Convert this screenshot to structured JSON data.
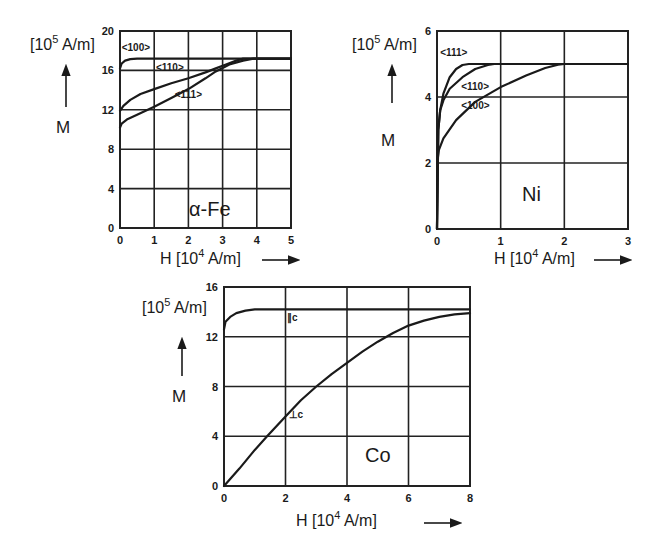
{
  "chart_data": [
    {
      "type": "line",
      "id": "fe",
      "title": "α-Fe",
      "xlabel": "H [10^4 A/m] →",
      "ylabel": "M",
      "yunit": "[10^5 A/m]",
      "xlim": [
        0,
        5
      ],
      "ylim": [
        0,
        20
      ],
      "xticks": [
        0,
        1,
        2,
        3,
        4,
        5
      ],
      "yticks": [
        0,
        4,
        8,
        12,
        16,
        20
      ],
      "grid": true,
      "box": {
        "x0": 120,
        "y0": 31,
        "x1": 291,
        "y1": 228
      },
      "series": [
        {
          "name": "<100>",
          "x": [
            0,
            0.05,
            0.15,
            0.3,
            0.5,
            1,
            2,
            3,
            4,
            5
          ],
          "y": [
            16.2,
            16.7,
            17.0,
            17.15,
            17.2,
            17.2,
            17.2,
            17.2,
            17.2,
            17.2
          ],
          "label_at": [
            0.05,
            18.0
          ]
        },
        {
          "name": "<110>",
          "x": [
            0,
            0.1,
            0.3,
            0.6,
            1.0,
            1.5,
            2.0,
            2.5,
            2.8,
            3.1,
            3.4,
            3.6,
            4,
            5
          ],
          "y": [
            11.9,
            12.4,
            13.0,
            13.6,
            14.1,
            14.7,
            15.2,
            15.8,
            16.2,
            16.6,
            17.0,
            17.2,
            17.2,
            17.2
          ],
          "label_at": [
            1.05,
            15.9
          ]
        },
        {
          "name": "<111>",
          "x": [
            0,
            0.05,
            0.2,
            0.5,
            1.0,
            1.5,
            2.0,
            2.5,
            2.8,
            3.2,
            3.6,
            3.9,
            4,
            5
          ],
          "y": [
            10.2,
            10.6,
            11.0,
            11.5,
            12.3,
            13.2,
            14.1,
            15.2,
            15.9,
            16.6,
            17.0,
            17.2,
            17.2,
            17.2
          ],
          "label_at": [
            1.6,
            13.2
          ]
        }
      ],
      "annotations": [
        "<100>",
        "<110>",
        "<111>",
        "α-Fe"
      ]
    },
    {
      "type": "line",
      "id": "ni",
      "title": "Ni",
      "xlabel": "H [10^4 A/m] →",
      "ylabel": "M",
      "yunit": "[10^5 A/m]",
      "xlim": [
        0,
        3
      ],
      "ylim": [
        0,
        6
      ],
      "xticks": [
        0,
        1,
        2,
        3
      ],
      "yticks": [
        0,
        2,
        4,
        6
      ],
      "grid": true,
      "box": {
        "x0": 437,
        "y0": 31,
        "x1": 628,
        "y1": 229
      },
      "series": [
        {
          "name": "<111>",
          "x": [
            0,
            0.02,
            0.05,
            0.1,
            0.2,
            0.3,
            0.4,
            0.5,
            1,
            2,
            3
          ],
          "y": [
            0,
            3.0,
            3.6,
            4.1,
            4.6,
            4.85,
            4.97,
            5.0,
            5.0,
            5.0,
            5.0
          ],
          "label_at": [
            0.05,
            5.25
          ]
        },
        {
          "name": "<110>",
          "x": [
            0,
            0.02,
            0.05,
            0.1,
            0.2,
            0.4,
            0.6,
            0.8,
            0.9,
            1,
            2,
            3
          ],
          "y": [
            0,
            3.0,
            3.6,
            3.9,
            4.25,
            4.6,
            4.85,
            4.97,
            5.0,
            5.0,
            5.0,
            5.0
          ],
          "label_at": [
            0.38,
            4.2
          ]
        },
        {
          "name": "<100>",
          "x": [
            0,
            0.01,
            0.03,
            0.1,
            0.3,
            0.6,
            1.0,
            1.4,
            1.7,
            1.9,
            2,
            3
          ],
          "y": [
            0,
            2.1,
            2.4,
            2.75,
            3.3,
            3.85,
            4.3,
            4.65,
            4.88,
            4.98,
            5.0,
            5.0
          ],
          "label_at": [
            0.38,
            3.65
          ]
        }
      ],
      "annotations": [
        "<111>",
        "<110>",
        "<100>",
        "Ni"
      ]
    },
    {
      "type": "line",
      "id": "co",
      "title": "Co",
      "xlabel": "H [10^4 A/m] →",
      "ylabel": "M",
      "yunit": "[10^5 A/m]",
      "xlim": [
        0,
        8
      ],
      "ylim": [
        0,
        16
      ],
      "xticks": [
        0,
        2,
        4,
        6,
        8
      ],
      "yticks": [
        0,
        4,
        8,
        12,
        16
      ],
      "grid": true,
      "box": {
        "x0": 224,
        "y0": 287,
        "x1": 470,
        "y1": 486
      },
      "series": [
        {
          "name": "∥c",
          "x": [
            0,
            0.05,
            0.2,
            0.4,
            0.7,
            1.0,
            1.5,
            2,
            4,
            6,
            8
          ],
          "y": [
            12.6,
            13.2,
            13.6,
            13.9,
            14.1,
            14.2,
            14.2,
            14.2,
            14.2,
            14.2,
            14.2
          ],
          "label_at": [
            2.05,
            13.3
          ]
        },
        {
          "name": "⊥c",
          "x": [
            0,
            0.5,
            1.0,
            1.4,
            2.0,
            2.5,
            3.0,
            3.5,
            4.0,
            4.5,
            5.0,
            5.5,
            6.0,
            6.5,
            7.0,
            7.5,
            8.0
          ],
          "y": [
            0,
            1.4,
            2.9,
            4.0,
            5.6,
            6.9,
            8.0,
            9.0,
            9.9,
            10.8,
            11.6,
            12.3,
            12.9,
            13.3,
            13.6,
            13.8,
            13.9
          ],
          "label_at": [
            2.1,
            5.5
          ]
        }
      ],
      "annotations": [
        "∥c",
        "⊥c",
        "Co"
      ]
    }
  ],
  "labels": {
    "fe_title": "α-Fe",
    "ni_title": "Ni",
    "co_title": "Co",
    "y_symbol": "M",
    "y_unit_prefix": "[10",
    "y_unit_exp": "5",
    "y_unit_suffix": " A/m]",
    "x_symbol_prefix": "H [10",
    "x_unit_exp": "4",
    "x_unit_suffix": " A/m]"
  }
}
